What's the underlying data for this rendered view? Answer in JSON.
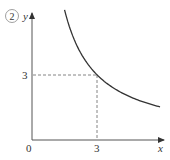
{
  "figure": {
    "label": "②",
    "colors": {
      "axis": "#555555",
      "curve": "#333333",
      "guide": "#666666",
      "text": "#333333"
    }
  },
  "chart_data": {
    "type": "line",
    "title": "",
    "label": "②",
    "xlabel": "x",
    "ylabel": "y",
    "origin_label": "0",
    "x_ticks": [
      "3"
    ],
    "y_ticks": [
      "3"
    ],
    "xlim": [
      0,
      6.1
    ],
    "ylim": [
      0,
      6.1
    ],
    "grid": false,
    "series": [
      {
        "name": "y = 9/x",
        "function": "y = 9/x",
        "x": [
          1.5,
          1.8,
          2,
          2.25,
          2.5,
          3,
          3.5,
          4,
          4.5,
          5,
          5.5,
          5.9
        ],
        "values": [
          6,
          5,
          4.5,
          4,
          3.6,
          3,
          2.57,
          2.25,
          2,
          1.8,
          1.64,
          1.53
        ]
      }
    ],
    "annotations": [
      {
        "type": "dashed-guide",
        "from": [
          0,
          3
        ],
        "to": [
          3,
          3
        ]
      },
      {
        "type": "dashed-guide",
        "from": [
          3,
          0
        ],
        "to": [
          3,
          3
        ]
      }
    ]
  }
}
